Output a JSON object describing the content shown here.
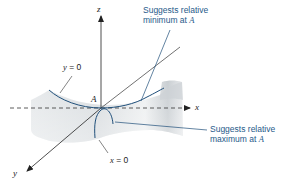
{
  "figure": {
    "axes": {
      "z_label": "z",
      "x_label": "x",
      "y_label": "y"
    },
    "point_label": "A",
    "curve_labels": {
      "y_zero": {
        "var": "y",
        "rest": " = 0"
      },
      "x_zero": {
        "var": "x",
        "rest": " = 0"
      }
    },
    "annotations": {
      "minimum": {
        "line1": "Suggests relative",
        "line2_prefix": "minimum at ",
        "line2_var": "A"
      },
      "maximum": {
        "line1": "Suggests relative",
        "line2_prefix": "maximum at ",
        "line2_var": "A"
      }
    },
    "colors": {
      "curve": "#1f4f7a",
      "annotation_text": "#1f5a8a",
      "axis": "#222222",
      "surface": "#d8dde0"
    }
  }
}
